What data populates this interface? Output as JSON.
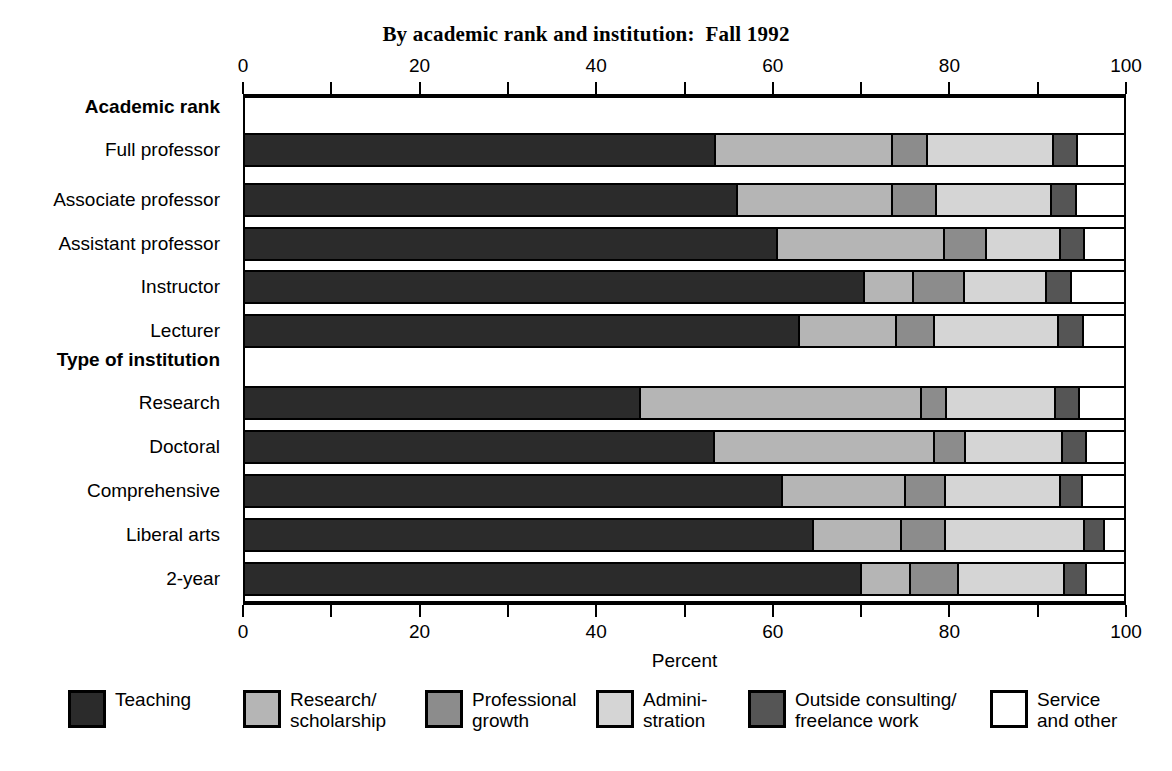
{
  "chart_data": {
    "type": "bar",
    "subtype": "stacked-horizontal-100pct",
    "title": "By academic rank and institution:  Fall 1992",
    "xlabel": "Percent",
    "ylabel": "",
    "xlim": [
      0,
      100
    ],
    "xticks": [
      0,
      10,
      20,
      30,
      40,
      50,
      60,
      70,
      80,
      90,
      100
    ],
    "xticklabels_shown": [
      "0",
      "20",
      "40",
      "60",
      "80",
      "100"
    ],
    "xticklabel_values": [
      0,
      20,
      40,
      60,
      80,
      100
    ],
    "grid": false,
    "legend_position": "bottom",
    "axis_top_duplicated": true,
    "groups": [
      {
        "name": "Academic rank",
        "categories": [
          "Full professor",
          "Associate professor",
          "Assistant professor",
          "Instructor",
          "Lecturer"
        ]
      },
      {
        "name": "Type of institution",
        "categories": [
          "Research",
          "Doctoral",
          "Comprehensive",
          "Liberal arts",
          "2-year"
        ]
      }
    ],
    "categories": [
      "Full professor",
      "Associate professor",
      "Assistant professor",
      "Instructor",
      "Lecturer",
      "Research",
      "Doctoral",
      "Comprehensive",
      "Liberal arts",
      "2-year"
    ],
    "series": [
      {
        "name": "Teaching",
        "color": "#2b2b2b",
        "values": [
          53.5,
          56.0,
          60.5,
          70.3,
          63.0,
          45.0,
          53.3,
          61.0,
          64.5,
          70.0
        ]
      },
      {
        "name": "Research/\nscholarship",
        "color": "#b5b5b5",
        "values": [
          20.0,
          17.5,
          18.9,
          5.6,
          11.0,
          31.8,
          25.0,
          14.0,
          10.0,
          5.5
        ]
      },
      {
        "name": "Professional\ngrowth",
        "color": "#8c8c8c",
        "values": [
          4.0,
          5.0,
          4.8,
          5.8,
          4.3,
          2.8,
          3.5,
          4.5,
          5.0,
          5.5
        ]
      },
      {
        "name": "Admini-\nstration",
        "color": "#d5d5d5",
        "values": [
          14.2,
          13.0,
          8.3,
          9.3,
          14.0,
          12.4,
          11.0,
          13.0,
          15.7,
          12.0
        ]
      },
      {
        "name": "Outside consulting/\nfreelance work",
        "color": "#555555",
        "values": [
          2.7,
          2.8,
          2.8,
          2.8,
          2.8,
          2.7,
          2.7,
          2.5,
          2.3,
          2.5
        ]
      },
      {
        "name": "Service\nand other",
        "color": "#ffffff",
        "values": [
          5.6,
          5.7,
          4.7,
          6.2,
          4.9,
          5.3,
          4.5,
          5.0,
          2.5,
          4.5
        ]
      }
    ]
  },
  "legend": {
    "items": [
      {
        "label": "Teaching",
        "color": "#2b2b2b"
      },
      {
        "label": "Research/\nscholarship",
        "color": "#b5b5b5"
      },
      {
        "label": "Professional\ngrowth",
        "color": "#8c8c8c"
      },
      {
        "label": "Admini-\nstration",
        "color": "#d5d5d5"
      },
      {
        "label": "Outside consulting/\nfreelance work",
        "color": "#555555"
      },
      {
        "label": "Service\nand other",
        "color": "#ffffff"
      }
    ]
  }
}
